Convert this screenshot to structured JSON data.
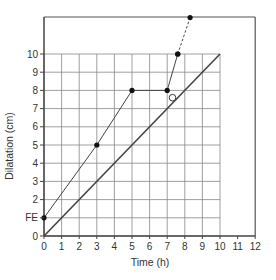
{
  "chart_data": {
    "type": "line",
    "title": "",
    "xlabel": "Time (h)",
    "ylabel": "Dilatation (cm)",
    "xlim": [
      0,
      12
    ],
    "ylim": [
      0,
      12
    ],
    "x_ticks": [
      "0",
      "1",
      "2",
      "3",
      "4",
      "5",
      "6",
      "7",
      "8",
      "9",
      "10",
      "11",
      "12"
    ],
    "y_ticks": [
      "0",
      "1",
      "2",
      "3",
      "4",
      "5",
      "6",
      "7",
      "8",
      "9",
      "10"
    ],
    "y_tick_special": {
      "value": 1,
      "label": "FE"
    },
    "grid": {
      "x_range": [
        0,
        10
      ],
      "y_range": [
        0,
        10
      ],
      "on": true
    },
    "series": [
      {
        "name": "Partogram (observed)",
        "style": "solid-with-markers",
        "points": [
          [
            0,
            1
          ],
          [
            3,
            5
          ],
          [
            5,
            8
          ],
          [
            7,
            8
          ],
          [
            7.6,
            10
          ]
        ]
      },
      {
        "name": "Partogram (projected)",
        "style": "dashed-with-markers",
        "points": [
          [
            7.6,
            10
          ],
          [
            8.3,
            12
          ]
        ]
      },
      {
        "name": "Reference line",
        "style": "solid",
        "points": [
          [
            0,
            0
          ],
          [
            10,
            10
          ]
        ]
      }
    ],
    "annotations": [
      {
        "label": "O",
        "x": 7.3,
        "y": 7.6,
        "shape": "open-circle"
      }
    ]
  }
}
